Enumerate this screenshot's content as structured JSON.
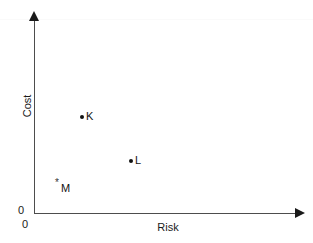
{
  "chart_data": {
    "type": "scatter",
    "title": "",
    "xlabel": "Risk",
    "ylabel": "Cost",
    "xlim": [
      0,
      10
    ],
    "ylim": [
      0,
      10
    ],
    "grid": false,
    "legend": null,
    "x_tick_labels": [
      "0"
    ],
    "y_tick_labels": [
      "0"
    ],
    "points": [
      {
        "label": "K",
        "x": 1.8,
        "y": 4.9,
        "marker": "dot",
        "px": 82,
        "py": 117
      },
      {
        "label": "L",
        "x": 3.6,
        "y": 2.6,
        "marker": "dot",
        "px": 131,
        "py": 161
      },
      {
        "label": "M",
        "x": 0.9,
        "y": 1.6,
        "marker": "asterisk",
        "px": 58,
        "py": 185
      }
    ],
    "annotations": [],
    "colors": {
      "background": "#ffffff",
      "axis": "#4d4d4d",
      "arrow": "#1a1a1a",
      "marker": "#111111",
      "text": "#1a1a1a"
    }
  },
  "axes": {
    "y_title": "Cost",
    "x_title": "Risk",
    "origin_y_label": "0",
    "origin_x_label": "0"
  },
  "markers": {
    "dot_glyph": "",
    "asterisk_glyph": "*"
  }
}
